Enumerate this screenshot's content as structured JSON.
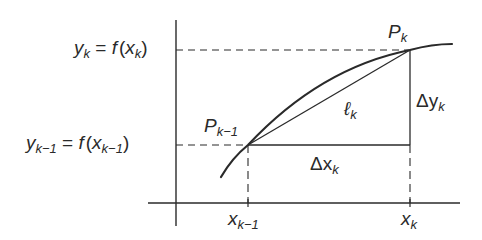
{
  "diagram": {
    "type": "arc-length-approximation",
    "axes": {
      "y_axis": {
        "x": 176,
        "y_top": 20,
        "y_bottom": 226
      },
      "x_axis": {
        "y": 203,
        "x_left": 148,
        "x_right": 460
      }
    },
    "points": {
      "p_prev": {
        "label_main": "P",
        "label_sub": "k−1",
        "x": 248,
        "y": 145
      },
      "p_k": {
        "label_main": "P",
        "label_sub": "k",
        "x": 410,
        "y": 50
      }
    },
    "curve": {
      "start": {
        "x": 221,
        "y": 177
      },
      "end": {
        "x": 452,
        "y": 44
      }
    },
    "labels": {
      "y_k": {
        "lhs": "y",
        "lhs_sub": "k",
        "eq": " = ",
        "f": "f",
        "open": "(",
        "arg": "x",
        "arg_sub": "k",
        "close": ")"
      },
      "y_prev": {
        "lhs": "y",
        "lhs_sub": "k−1",
        "eq": " = ",
        "f": "f",
        "open": "(",
        "arg": "x",
        "arg_sub": "k−1",
        "close": ")"
      },
      "x_prev": {
        "main": "x",
        "sub": "k−1"
      },
      "x_k": {
        "main": "x",
        "sub": "k"
      },
      "delta_x": {
        "main": "Δx",
        "sub": "k"
      },
      "delta_y": {
        "main": "Δy",
        "sub": "k"
      },
      "chord": {
        "main": "ℓ",
        "sub": "k"
      }
    },
    "colors": {
      "stroke": "#2a2a2a",
      "background": "#ffffff"
    }
  }
}
